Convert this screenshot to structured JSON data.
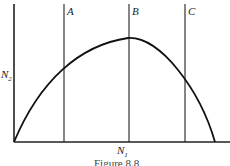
{
  "figure": {
    "caption": "Figure 8.8",
    "x_axis_label": "N",
    "x_axis_sub": "1",
    "y_axis_label": "N",
    "y_axis_sub": "2",
    "vertical_lines": [
      {
        "label": "A",
        "x": 64
      },
      {
        "label": "B",
        "x": 129
      },
      {
        "label": "C",
        "x": 185
      }
    ],
    "curve": "concave parabola from origin to baseline, peaking near line B"
  }
}
